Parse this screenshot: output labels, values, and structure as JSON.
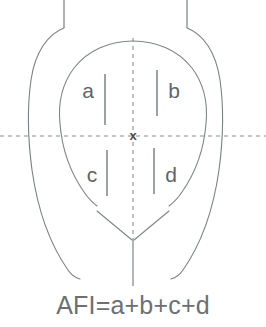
{
  "figure": {
    "formula": "AFI=a+b+c+d",
    "center_marker": "x",
    "quadrants": [
      {
        "id": "upper-left",
        "label": "a"
      },
      {
        "id": "upper-right",
        "label": "b"
      },
      {
        "id": "lower-left",
        "label": "c"
      },
      {
        "id": "lower-right",
        "label": "d"
      }
    ],
    "colors": {
      "background": "#ffffff",
      "outline": "#7a8085",
      "sac_outline": "#7e8489",
      "axis": "#8a9095",
      "measure": "#73797e",
      "label_text": "#5e6468",
      "formula_text": "#6a7074"
    }
  }
}
